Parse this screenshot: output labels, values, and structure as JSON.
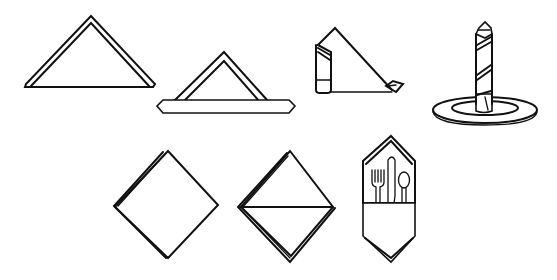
{
  "diagram": {
    "background_color": "#ffffff",
    "line_color": "#111111",
    "figures": [
      {
        "id": "step-1",
        "name": "folded triangle",
        "row": 1
      },
      {
        "id": "step-2",
        "name": "triangle with folded bottom band",
        "row": 1
      },
      {
        "id": "step-3",
        "name": "triangle being rolled into tube",
        "row": 1
      },
      {
        "id": "step-4",
        "name": "rolled candle napkin standing on plate",
        "row": 1
      },
      {
        "id": "step-5",
        "name": "square diamond, layered",
        "row": 2
      },
      {
        "id": "step-6",
        "name": "diamond with horizontal fold",
        "row": 2
      },
      {
        "id": "step-7",
        "name": "pocket napkin holding fork, knife and spoon",
        "row": 2
      }
    ]
  }
}
